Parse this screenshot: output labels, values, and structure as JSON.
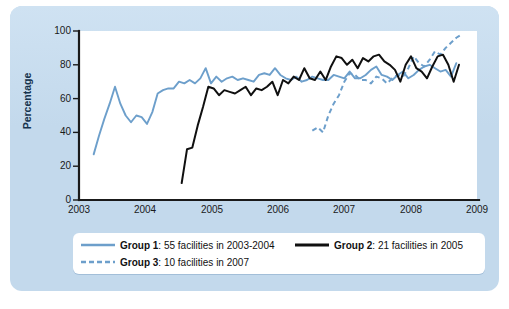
{
  "chart_data": {
    "type": "line",
    "title": "",
    "xlabel": "",
    "ylabel": "Percentage",
    "xlim": [
      2003,
      2009
    ],
    "ylim": [
      0,
      100
    ],
    "grid": false,
    "legend_position": "bottom",
    "x_ticks": [
      "2003",
      "2004",
      "2005",
      "2006",
      "2007",
      "2008",
      "2009"
    ],
    "y_ticks": [
      "0",
      "20",
      "40",
      "60",
      "80",
      "100"
    ],
    "series": [
      {
        "name": "Group 1",
        "label": "Group 1: 55 facilities in 2003-2004",
        "color": "#6d9fcb",
        "style": "solid",
        "x": [
          2003.22,
          2003.3,
          2003.38,
          2003.46,
          2003.54,
          2003.62,
          2003.7,
          2003.78,
          2003.86,
          2003.94,
          2004.02,
          2004.1,
          2004.18,
          2004.26,
          2004.34,
          2004.42,
          2004.5,
          2004.58,
          2004.66,
          2004.74,
          2004.82,
          2004.9,
          2004.98,
          2005.06,
          2005.14,
          2005.22,
          2005.3,
          2005.38,
          2005.46,
          2005.54,
          2005.62,
          2005.7,
          2005.78,
          2005.86,
          2005.94,
          2006.02,
          2006.1,
          2006.18,
          2006.26,
          2006.34,
          2006.42,
          2006.5,
          2006.58,
          2006.66,
          2006.74,
          2006.82,
          2006.9,
          2006.98,
          2007.06,
          2007.14,
          2007.22,
          2007.3,
          2007.38,
          2007.46,
          2007.54,
          2007.62,
          2007.7,
          2007.78,
          2007.86,
          2007.94,
          2008.02,
          2008.1,
          2008.18,
          2008.26,
          2008.34,
          2008.42,
          2008.5,
          2008.58,
          2008.66
        ],
        "values": [
          27,
          38,
          48,
          57,
          67,
          57,
          50,
          46,
          50,
          49,
          45,
          52,
          63,
          65,
          66,
          66,
          70,
          69,
          71,
          69,
          72,
          78,
          69,
          73,
          70,
          72,
          73,
          71,
          72,
          71,
          70,
          74,
          75,
          74,
          78,
          74,
          72,
          71,
          73,
          70,
          71,
          73,
          72,
          71,
          71,
          74,
          73,
          72,
          76,
          72,
          72,
          74,
          77,
          79,
          74,
          73,
          71,
          74,
          76,
          72,
          74,
          77,
          79,
          80,
          78,
          76,
          77,
          73,
          81
        ]
      },
      {
        "name": "Group 2",
        "label": "Group 2: 21 facilities in 2005",
        "color": "#101010",
        "style": "solid",
        "x": [
          2004.54,
          2004.62,
          2004.7,
          2004.78,
          2004.86,
          2004.94,
          2005.02,
          2005.1,
          2005.18,
          2005.26,
          2005.34,
          2005.42,
          2005.5,
          2005.58,
          2005.66,
          2005.74,
          2005.82,
          2005.9,
          2005.98,
          2006.06,
          2006.14,
          2006.22,
          2006.3,
          2006.38,
          2006.46,
          2006.54,
          2006.62,
          2006.7,
          2006.78,
          2006.86,
          2006.94,
          2007.02,
          2007.1,
          2007.18,
          2007.26,
          2007.34,
          2007.42,
          2007.5,
          2007.58,
          2007.66,
          2007.74,
          2007.82,
          2007.9,
          2007.98,
          2008.06,
          2008.14,
          2008.22,
          2008.3,
          2008.38,
          2008.46,
          2008.54,
          2008.62,
          2008.7
        ],
        "values": [
          10,
          30,
          31,
          44,
          55,
          67,
          66,
          62,
          65,
          64,
          63,
          65,
          67,
          62,
          66,
          65,
          67,
          70,
          62,
          71,
          69,
          73,
          71,
          78,
          72,
          71,
          76,
          71,
          79,
          85,
          84,
          80,
          83,
          78,
          84,
          82,
          85,
          86,
          82,
          80,
          77,
          70,
          80,
          85,
          78,
          76,
          72,
          79,
          85,
          86,
          80,
          70,
          80
        ]
      },
      {
        "name": "Group 3",
        "label": "Group 3: 10 facilities in 2007",
        "color": "#6d9fcb",
        "style": "dashed",
        "x": [
          2006.5,
          2006.58,
          2006.66,
          2006.74,
          2006.82,
          2006.9,
          2006.98,
          2007.06,
          2007.14,
          2007.22,
          2007.3,
          2007.38,
          2007.46,
          2007.54,
          2007.62,
          2007.7,
          2007.78,
          2007.86,
          2007.94,
          2008.02,
          2008.1,
          2008.18,
          2008.26,
          2008.34,
          2008.42,
          2008.5,
          2008.58,
          2008.66,
          2008.74
        ],
        "values": [
          41,
          43,
          40,
          50,
          57,
          62,
          70,
          75,
          74,
          71,
          71,
          69,
          73,
          72,
          69,
          72,
          74,
          73,
          78,
          85,
          81,
          79,
          83,
          88,
          86,
          90,
          93,
          96,
          98
        ]
      }
    ]
  },
  "axes": {
    "y_label": "Percentage",
    "y_ticks": [
      "100",
      "80",
      "60",
      "40",
      "20",
      "0"
    ],
    "x_ticks": [
      "2003",
      "2004",
      "2005",
      "2006",
      "2007",
      "2008",
      "2009"
    ]
  },
  "legend": {
    "items": [
      {
        "name_bold": "Group 1",
        "rest": ": 55 facilities in 2003-2004",
        "swatch": "solid-blue-line-swatch"
      },
      {
        "name_bold": "Group 2",
        "rest": ": 21 facilities in 2005",
        "swatch": "solid-black-line-swatch"
      },
      {
        "name_bold": "Group 3",
        "rest": ": 10 facilities in 2007",
        "swatch": "dashed-blue-line-swatch"
      }
    ]
  },
  "colors": {
    "group1": "#6d9fcb",
    "group2": "#101010",
    "group3": "#6d9fcb",
    "panel": "#c3d9ec",
    "plot_bg": "#ffffff",
    "axis": "#1a1a1a"
  }
}
